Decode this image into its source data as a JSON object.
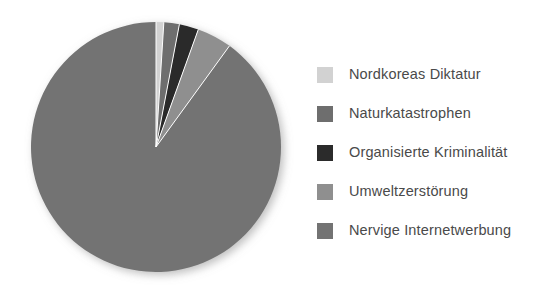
{
  "chart_data": {
    "type": "pie",
    "title": "",
    "subtitle": "",
    "xlabel": "",
    "ylabel": "",
    "grid": false,
    "legend_position": "right",
    "start_angle_deg": 0,
    "direction": "clockwise",
    "categories": [
      "Nordkoreas Diktatur",
      "Naturkatastrophen",
      "Organisierte Kriminalität",
      "Umweltzerstörung",
      "Nervige Internetwerbung"
    ],
    "values": [
      1,
      2,
      2.5,
      4.5,
      90
    ],
    "colors": [
      "#d2d2d2",
      "#6e6e6e",
      "#2b2b2b",
      "#8f8f8f",
      "#737373"
    ],
    "annotations": []
  },
  "legend": {
    "items": [
      {
        "label": "Nordkoreas Diktatur",
        "color": "#d2d2d2",
        "swatch_name": "legend-swatch-nordkoreas-diktatur"
      },
      {
        "label": "Naturkatastrophen",
        "color": "#6e6e6e",
        "swatch_name": "legend-swatch-naturkatastrophen"
      },
      {
        "label": "Organisierte Kriminalität",
        "color": "#2b2b2b",
        "swatch_name": "legend-swatch-organisierte-kriminalitaet"
      },
      {
        "label": "Umweltzerstörung",
        "color": "#8f8f8f",
        "swatch_name": "legend-swatch-umweltzerstoerung"
      },
      {
        "label": "Nervige Internetwerbung",
        "color": "#737373",
        "swatch_name": "legend-swatch-nervige-internetwerbung"
      }
    ]
  },
  "pie": {
    "center_x": 156,
    "center_y": 147,
    "radius": 125,
    "separator_color": "#ffffff",
    "shadow_color": "#b8b8b8"
  }
}
